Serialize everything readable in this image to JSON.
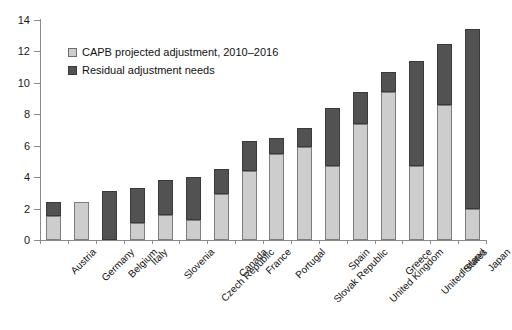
{
  "chart_data": {
    "type": "bar",
    "stacked": true,
    "title": "",
    "subtitle": "",
    "xlabel": "",
    "ylabel": "",
    "ylim": [
      0,
      14
    ],
    "yticks": [
      0,
      2,
      4,
      6,
      8,
      10,
      12,
      14
    ],
    "ytick_labels": [
      "0",
      "2",
      "4",
      "6",
      "8",
      "10",
      "12",
      "14"
    ],
    "grid": false,
    "legend_position": "upper-left-inside",
    "categories": [
      "Austria",
      "Germany",
      "Belgium",
      "Italy",
      "Slovenia",
      "Czech Republic",
      "Canada",
      "France",
      "Portugal",
      "Slovak Republic",
      "Spain",
      "United Kingdom",
      "Greece",
      "United States",
      "Ireland",
      "Japan"
    ],
    "series": [
      {
        "name": "CAPB projected adjustment, 2010–2016",
        "color": "#cdcdcd",
        "values": [
          1.5,
          2.4,
          0.0,
          1.1,
          1.6,
          1.3,
          2.9,
          4.4,
          5.5,
          5.9,
          4.7,
          7.4,
          9.4,
          4.7,
          8.6,
          2.0
        ]
      },
      {
        "name": "Residual adjustment needs",
        "color": "#525252",
        "values": [
          0.9,
          0.0,
          3.1,
          2.2,
          2.2,
          2.7,
          1.6,
          1.9,
          1.0,
          1.2,
          3.7,
          2.0,
          1.3,
          6.7,
          3.9,
          11.4
        ]
      }
    ],
    "totals": [
      2.4,
      2.4,
      3.1,
      3.3,
      3.8,
      4.0,
      4.5,
      6.3,
      6.5,
      7.1,
      8.4,
      9.4,
      10.7,
      11.4,
      12.5,
      13.4
    ]
  },
  "legend": {
    "items": [
      {
        "label": "CAPB projected adjustment, 2010–2016",
        "swatch": "light"
      },
      {
        "label": "Residual adjustment needs",
        "swatch": "dark"
      }
    ]
  },
  "colors": {
    "light_gray": "#cdcdcd",
    "dark_gray": "#525252",
    "axis": "#8a8a8a",
    "background": "#ffffff"
  }
}
